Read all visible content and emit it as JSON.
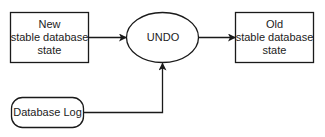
{
  "diagram": {
    "type": "flow",
    "nodes": [
      {
        "id": "new_state",
        "shape": "rectangle",
        "label": "New\nstable database\nstate"
      },
      {
        "id": "undo",
        "shape": "ellipse",
        "label": "UNDO"
      },
      {
        "id": "old_state",
        "shape": "rectangle",
        "label": "Old\nstable database\nstate"
      },
      {
        "id": "db_log",
        "shape": "rounded-rectangle",
        "label": "Database Log"
      }
    ],
    "edges": [
      {
        "from": "new_state",
        "to": "undo"
      },
      {
        "from": "undo",
        "to": "old_state"
      },
      {
        "from": "db_log",
        "to": "undo"
      }
    ]
  },
  "labels": {
    "new_line1": "New",
    "new_line2": "stable database",
    "new_line3": "state",
    "undo": "UNDO",
    "old_line1": "Old",
    "old_line2": "stable database",
    "old_line3": "state",
    "db_log": "Database Log"
  },
  "colors": {
    "stroke": "#1a1a1a",
    "background": "#ffffff"
  }
}
